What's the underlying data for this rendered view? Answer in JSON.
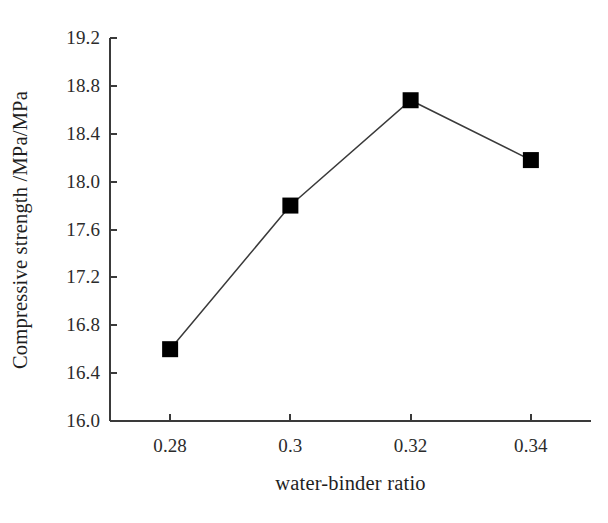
{
  "chart_data": {
    "type": "line",
    "title": "",
    "xlabel": "water-binder ratio",
    "ylabel": "Compressive strength /MPa/MPa",
    "x": [
      0.28,
      0.3,
      0.32,
      0.34
    ],
    "values": [
      16.6,
      17.8,
      18.68,
      18.18
    ],
    "series": [
      {
        "name": "compressive strength",
        "values": [
          16.6,
          17.8,
          18.68,
          18.18
        ],
        "marker": "filled-square",
        "marker_color": "#000000",
        "line_color": "#3a3a3a"
      }
    ],
    "xlim": [
      0.27,
      0.35
    ],
    "ylim": [
      16.0,
      19.2
    ],
    "xticks": [
      0.28,
      0.3,
      0.32,
      0.34
    ],
    "xtick_labels": [
      "0.28",
      "0.3",
      "0.32",
      "0.34"
    ],
    "yticks": [
      16.0,
      16.4,
      16.8,
      17.2,
      17.6,
      18.0,
      18.4,
      18.8,
      19.2
    ],
    "ytick_labels": [
      "16.0",
      "16.4",
      "16.8",
      "17.2",
      "17.6",
      "18.0",
      "18.4",
      "18.8",
      "19.2"
    ],
    "grid": false,
    "legend": false,
    "legend_position": "none",
    "tick_direction": "in",
    "spines": [
      "left",
      "bottom"
    ],
    "axis_color": "#3a3a3a",
    "background": "#ffffff"
  },
  "axes": {
    "y_title": "Compressive strength /MPa/MPa",
    "x_title": "water-binder ratio"
  }
}
